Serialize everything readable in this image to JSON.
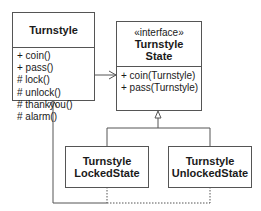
{
  "diagram": {
    "type": "UML class diagram",
    "classes": {
      "turnstyle": {
        "name": "Turnstyle",
        "operations": [
          "+ coin()",
          "+ pass()",
          "# lock()",
          "# unlock()",
          "# thankyou()",
          "# alarm()"
        ]
      },
      "state": {
        "stereotype": "«interface»",
        "name_line1": "Turnstyle",
        "name_line2": "State",
        "operations": [
          "+ coin(Turnstyle)",
          "+ pass(Turnstyle)"
        ]
      },
      "locked": {
        "name_line1": "Turnstyle",
        "name_line2": "LockedState"
      },
      "unlocked": {
        "name_line1": "Turnstyle",
        "name_line2": "UnlockedState"
      }
    },
    "relationships": [
      {
        "from": "Turnstyle",
        "to": "TurnstyleState",
        "kind": "association"
      },
      {
        "from": "TurnstyleLockedState",
        "to": "TurnstyleState",
        "kind": "realization"
      },
      {
        "from": "TurnstyleUnlockedState",
        "to": "TurnstyleState",
        "kind": "realization"
      },
      {
        "from": "TurnstyleLockedState",
        "to": "Turnstyle",
        "kind": "dependency"
      },
      {
        "from": "TurnstyleUnlockedState",
        "to": "Turnstyle",
        "kind": "dependency"
      }
    ],
    "colors": {
      "line": "#555555",
      "text": "#1a1a1a",
      "background": "#ffffff"
    }
  }
}
